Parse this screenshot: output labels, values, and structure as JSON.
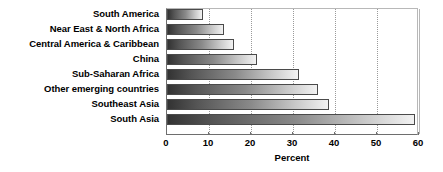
{
  "chart_data": {
    "type": "bar",
    "orientation": "horizontal",
    "title": "",
    "xlabel": "Percent",
    "ylabel": "",
    "categories": [
      "South America",
      "Near East & North Africa",
      "Central America & Caribbean",
      "China",
      "Sub-Saharan Africa",
      "Other emerging countries",
      "Southeast Asia",
      "South Asia"
    ],
    "values": [
      8.5,
      13.5,
      16,
      21.5,
      31.5,
      36,
      38.5,
      59
    ],
    "xlim": [
      0,
      60
    ],
    "xticks": [
      0,
      10,
      20,
      30,
      40,
      50,
      60
    ],
    "xtick_labels": [
      "0",
      "10",
      "20",
      "30",
      "40",
      "50",
      "60"
    ],
    "grid": true,
    "grid_axis": "x",
    "legend": false,
    "bar_style": {
      "fill": "gradient",
      "gradient_from": "#333333",
      "gradient_to": "#f2f2f2",
      "border_color": "#4a4a4a"
    }
  }
}
